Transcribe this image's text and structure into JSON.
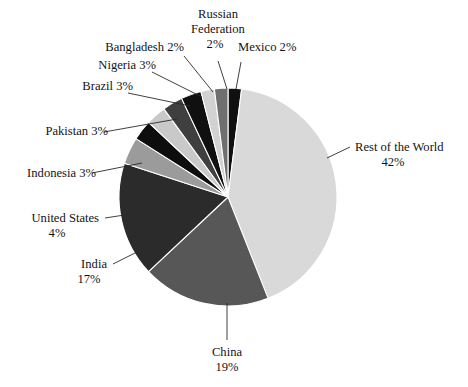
{
  "chart_data": {
    "type": "pie",
    "title": "",
    "subtitle": "",
    "xlabel": "",
    "ylabel": "",
    "legend_position": "none",
    "grid": false,
    "label_format": "{name} {value}%",
    "total": 100,
    "units": "percent",
    "start_angle_deg": 0,
    "direction": "clockwise",
    "categories": [
      "Mexico",
      "Rest of the World",
      "China",
      "India",
      "United States",
      "Indonesia",
      "Pakistan",
      "Brazil",
      "Nigeria",
      "Bangladesh",
      "Russian Federation"
    ],
    "values": [
      2,
      42,
      19,
      17,
      4,
      3,
      3,
      3,
      3,
      2,
      2
    ],
    "colors": [
      "#101010",
      "#d9d9d9",
      "#575757",
      "#2b2b2b",
      "#9b9b9b",
      "#0d0d0d",
      "#c9c9c9",
      "#3f3f3f",
      "#101010",
      "#d2d2d2",
      "#6f6f6f"
    ],
    "slices": [
      {
        "name": "Mexico",
        "value": 2,
        "label": "Mexico 2%",
        "name_text": "Mexico",
        "value_text": "2%",
        "color": "#101010",
        "start_deg": 0,
        "end_deg": 7.2
      },
      {
        "name": "Rest of the World",
        "value": 42,
        "label": "Rest of the World 42%",
        "name_text": "Rest of the World",
        "value_text": "42%",
        "color": "#d9d9d9",
        "start_deg": 7.2,
        "end_deg": 158.4
      },
      {
        "name": "China",
        "value": 19,
        "label": "China 19%",
        "name_text": "China",
        "value_text": "19%",
        "color": "#575757",
        "start_deg": 158.4,
        "end_deg": 226.8
      },
      {
        "name": "India",
        "value": 17,
        "label": "India 17%",
        "name_text": "India",
        "value_text": "17%",
        "color": "#2b2b2b",
        "start_deg": 226.8,
        "end_deg": 288.0
      },
      {
        "name": "United States",
        "value": 4,
        "label": "United States 4%",
        "name_text": "United States",
        "value_text": "4%",
        "color": "#9b9b9b",
        "start_deg": 288.0,
        "end_deg": 302.4
      },
      {
        "name": "Indonesia",
        "value": 3,
        "label": "Indonesia 3%",
        "name_text": "Indonesia",
        "value_text": "3%",
        "color": "#0d0d0d",
        "start_deg": 302.4,
        "end_deg": 313.2
      },
      {
        "name": "Pakistan",
        "value": 3,
        "label": "Pakistan 3%",
        "name_text": "Pakistan",
        "value_text": "3%",
        "color": "#c9c9c9",
        "start_deg": 313.2,
        "end_deg": 324.0
      },
      {
        "name": "Brazil",
        "value": 3,
        "label": "Brazil 3%",
        "name_text": "Brazil",
        "value_text": "3%",
        "color": "#3f3f3f",
        "start_deg": 324.0,
        "end_deg": 334.8
      },
      {
        "name": "Nigeria",
        "value": 3,
        "label": "Nigeria 3%",
        "name_text": "Nigeria",
        "value_text": "3%",
        "color": "#101010",
        "start_deg": 334.8,
        "end_deg": 345.6
      },
      {
        "name": "Bangladesh",
        "value": 2,
        "label": "Bangladesh 2%",
        "name_text": "Bangladesh",
        "value_text": "2%",
        "color": "#d2d2d2",
        "start_deg": 345.6,
        "end_deg": 352.8
      },
      {
        "name": "Russian Federation",
        "value": 2,
        "label": "Russian Federation 2%",
        "name_text": "Russian Federation",
        "value_text": "2%",
        "color": "#6f6f6f",
        "start_deg": 352.8,
        "end_deg": 360.0
      }
    ]
  },
  "labels": {
    "russian_federation_line1": "Russian",
    "russian_federation_line2": "Federation",
    "russian_federation_line3": "2%",
    "bangladesh": "Bangladesh 2%",
    "mexico": "Mexico 2%",
    "nigeria": "Nigeria 3%",
    "brazil": "Brazil 3%",
    "pakistan": "Pakistan 3%",
    "indonesia": "Indonesia 3%",
    "rest_of_world_line1": "Rest of the World",
    "rest_of_world_line2": "42%",
    "united_states_line1": "United States",
    "united_states_line2": "4%",
    "india_line1": "India",
    "india_line2": "17%",
    "china_line1": "China",
    "china_line2": "19%"
  },
  "style": {
    "background": "#ffffff",
    "text_color": "#141414",
    "leader_color": "#2a2a2a",
    "slice_border": "#ffffff"
  }
}
